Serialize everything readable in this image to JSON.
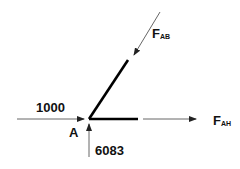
{
  "diagram": {
    "type": "free-body-diagram",
    "joint_label": "A",
    "members": [
      {
        "name": "AH",
        "direction": "horizontal"
      },
      {
        "name": "AB",
        "direction": "inclined"
      }
    ],
    "forces": {
      "applied_horizontal": {
        "value": "1000",
        "direction": "right"
      },
      "reaction_vertical": {
        "value": "6083",
        "direction": "up"
      },
      "member_AB": {
        "symbol": "F",
        "subscript": "AB",
        "direction": "toward-joint"
      },
      "member_AH": {
        "symbol": "F",
        "subscript": "AH",
        "direction": "away-from-joint"
      }
    },
    "colors": {
      "members": "#000000",
      "arrows": "#444444",
      "text": "#111111"
    }
  }
}
